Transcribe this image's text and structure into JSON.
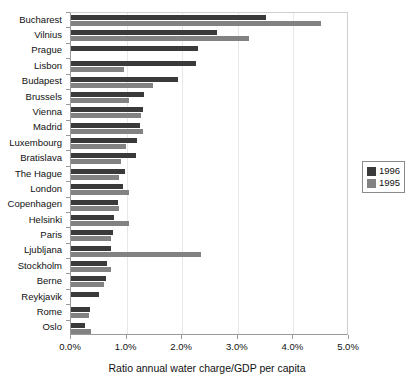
{
  "chart_data": {
    "type": "bar",
    "orientation": "horizontal",
    "title": "",
    "xlabel": "Ratio annual water charge/GDP per capita",
    "ylabel": "",
    "xlim": [
      0.0,
      5.0
    ],
    "xticks": [
      "0.0%",
      "1.0%",
      "2.0%",
      "3.0%",
      "4.0%",
      "5.0%"
    ],
    "xtick_values": [
      0.0,
      1.0,
      2.0,
      3.0,
      4.0,
      5.0
    ],
    "grid": false,
    "legend_position": "right",
    "categories": [
      "Bucharest",
      "Vilnius",
      "Prague",
      "Lisbon",
      "Budapest",
      "Brussels",
      "Vienna",
      "Madrid",
      "Luxembourg",
      "Bratislava",
      "The Hague",
      "London",
      "Copenhagen",
      "Helsinki",
      "Paris",
      "Ljubljana",
      "Stockholm",
      "Berne",
      "Reykjavik",
      "Rome",
      "Oslo"
    ],
    "series": [
      {
        "name": "1996",
        "color": "#3a3a3a",
        "values": [
          3.5,
          2.62,
          2.28,
          2.25,
          1.92,
          1.31,
          1.29,
          1.24,
          1.19,
          1.17,
          0.97,
          0.94,
          0.85,
          0.77,
          0.75,
          0.72,
          0.65,
          0.63,
          0.5,
          0.34,
          0.25
        ]
      },
      {
        "name": "1995",
        "color": "#828282",
        "values": [
          4.5,
          3.2,
          0.0,
          0.95,
          1.47,
          1.04,
          1.26,
          1.3,
          0.99,
          0.9,
          0.86,
          1.04,
          0.86,
          1.04,
          0.72,
          2.34,
          0.72,
          0.59,
          0.0,
          0.32,
          0.36
        ]
      }
    ],
    "legend": [
      {
        "label": "1996",
        "color": "#3a3a3a"
      },
      {
        "label": "1995",
        "color": "#828282"
      }
    ]
  }
}
